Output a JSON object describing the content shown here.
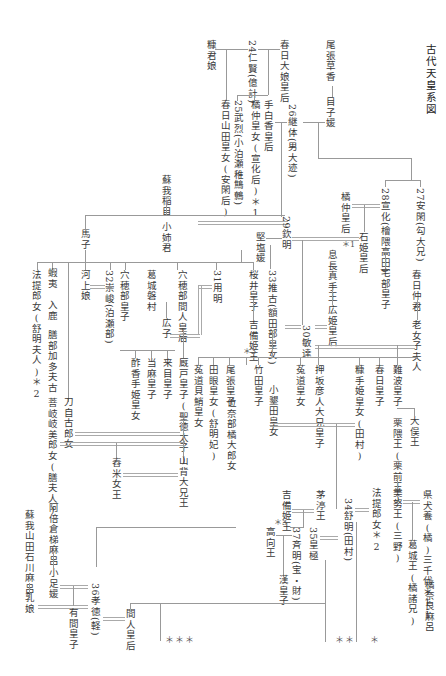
{
  "title": "古代天皇系図",
  "nodes": {
    "owari_kusaka": "尾張草香",
    "menoko": "目子媛",
    "kasuga_oiratsume": "春日大娘皇后",
    "e24": "24仁賢(億計)",
    "nukakimi": "糠君娘",
    "kasuga_yamada": "春日山田皇女(安閑后)",
    "e25": "25武烈(小泊瀬稚鷦鷯)",
    "tachibana_nakatsu": "橘仲皇女(宣化后)＊1",
    "tashiraka": "手白香皇后",
    "e26": "26継体(男大迹)",
    "e27": "27安閑(勾大兄)",
    "e28": "28宣化(檜隈高田)",
    "tachibana_kogo": "橘仲皇后",
    "tachibana_mark": "＊1",
    "ishihime": "石姫皇后",
    "yakabe": "宅部皇子",
    "soga_iname": "蘇我稲目",
    "oane": "小姉君",
    "umako": "馬子",
    "kitashi": "堅塩媛",
    "e29": "29欽明",
    "kasuga_naka": "春日仲君",
    "ominako": "老女子夫人",
    "okinaga": "息長真手王",
    "hirohime": "広姫皇后",
    "e30": "30敏達",
    "e31": "31用明",
    "e32": "32崇峻(泊瀬部)",
    "e33": "33推古(額田部皇女)",
    "sakurai": "桜井皇子",
    "kibi_hime": "吉備姫王",
    "kibi_mark": "＊3",
    "anahobe_hashihito": "穴穂部間人皇后",
    "anahobe_miko": "穴穂部皇子",
    "katsuragi_nimuraji": "葛城磐村",
    "hiroko": "広子",
    "kawakami": "河上娘",
    "emishi": "蝦夷",
    "iruka": "入鹿",
    "kashiwade": "膳部加多夫古",
    "hokiki": "菩岐岐美郎女(膳夫人)",
    "tojiko": "刀自古郎女",
    "hote": "法提郎女(舒明夫人)＊2",
    "sukate": "酢香手姫皇女",
    "taima": "当麻皇子",
    "kume": "来目皇子",
    "umayado": "厩戸皇子(聖徳太子)",
    "uji_kaidako": "菟道貝鮹皇女",
    "tame": "田眼皇女(舒明妃)",
    "owari_miko": "尾張皇子",
    "takeda": "竹田皇子",
    "inabe": "位奈部橘大郎女",
    "oharida": "小墾田皇女",
    "uji_himemiko": "菟道皇女",
    "oshisaka": "押坂彦人大兄皇子",
    "nukate": "糠手姫皇女(田村)",
    "kasuga_miko": "春日皇子",
    "naniwa": "難波皇子",
    "kurikuma": "栗隈王(栗前王)",
    "omata": "大俣王",
    "tsukishine": "舂米女王",
    "yamashiro": "山背大兄王",
    "chinu": "茅渟王",
    "kibi_hime2": "吉備姫王",
    "kibi_mark2": "＊3",
    "takamuku": "高向王",
    "e34": "34舒明(田村)",
    "e35": "35皇極",
    "e37": "37斉明(宝・財)",
    "aya": "漢皇子",
    "hote2": "法提郎女＊2",
    "minu": "美努王(三野)",
    "agata": "県犬養(橘)三千代＊11",
    "katsuragi_o": "葛城王(橘諸兄)",
    "naramaro": "橘奈良麻呂",
    "soga_yamada": "蘇我山田石川麻呂",
    "chi_no_iratsume": "乳娘",
    "abe_kurahashi": "阿倍倉梯麻呂",
    "otarashi": "小足媛",
    "e36": "36孝徳(軽)",
    "arima": "有間皇子",
    "hashihito_kogo": "間人皇后"
  },
  "continuation_marks": {
    "triple": "＊＊＊",
    "double": "＊＊",
    "single": "＊"
  },
  "colors": {
    "line": "#999999",
    "text": "#3a3a3a",
    "background": "#ffffff"
  }
}
